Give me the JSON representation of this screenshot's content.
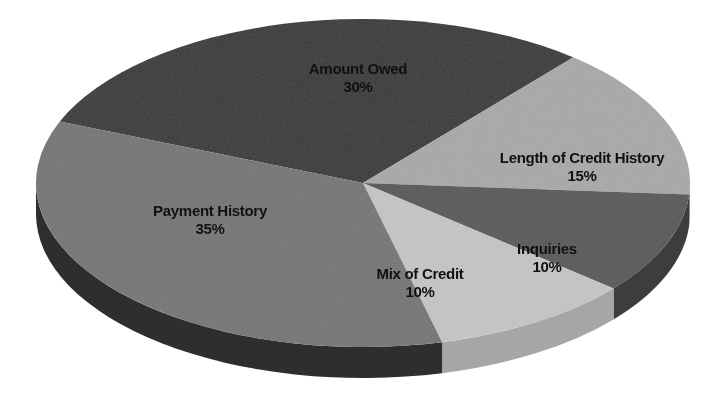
{
  "chart_data": {
    "type": "pie",
    "style": "3d",
    "title": "",
    "slices": [
      {
        "label": "Amount Owed",
        "value": 30,
        "display": "30%",
        "top_color": "#3b3b3b",
        "side_color": "#262626"
      },
      {
        "label": "Length of Credit History",
        "value": 15,
        "display": "15%",
        "top_color": "#a9a9a9",
        "side_color": "#8a8a8a"
      },
      {
        "label": "Inquiries",
        "value": 10,
        "display": "10%",
        "top_color": "#5a5a5a",
        "side_color": "#3e3e3e"
      },
      {
        "label": "Mix of Credit",
        "value": 10,
        "display": "10%",
        "top_color": "#c4c4c4",
        "side_color": "#a6a6a6"
      },
      {
        "label": "Payment History",
        "value": 35,
        "display": "35%",
        "top_color": "#777777",
        "side_color": "#2e2e2e"
      }
    ],
    "legend": "none (labels on slices)"
  },
  "geometry": {
    "cx": 363,
    "cy": 183,
    "rx": 327,
    "ry": 164,
    "depth": 31,
    "start_angle_deg": 202
  },
  "labels": [
    {
      "name": "Amount Owed",
      "pct": "30%",
      "x": 358,
      "y": 78
    },
    {
      "name": "Length of Credit History",
      "pct": "15%",
      "x": 582,
      "y": 167
    },
    {
      "name": "Inquiries",
      "pct": "10%",
      "x": 547,
      "y": 258
    },
    {
      "name": "Mix of Credit",
      "pct": "10%",
      "x": 420,
      "y": 283
    },
    {
      "name": "Payment History",
      "pct": "35%",
      "x": 210,
      "y": 220
    }
  ]
}
